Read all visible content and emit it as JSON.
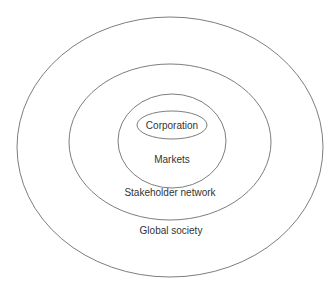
{
  "diagram": {
    "type": "concentric-ellipses",
    "layers": [
      {
        "id": "corporation",
        "label": "Corporation"
      },
      {
        "id": "markets",
        "label": "Markets"
      },
      {
        "id": "stakeholder-network",
        "label": "Stakeholder network"
      },
      {
        "id": "global-society",
        "label": "Global society"
      }
    ],
    "colors": {
      "stroke": "#6e6e6e",
      "text": "#333333",
      "background": "#ffffff"
    }
  }
}
